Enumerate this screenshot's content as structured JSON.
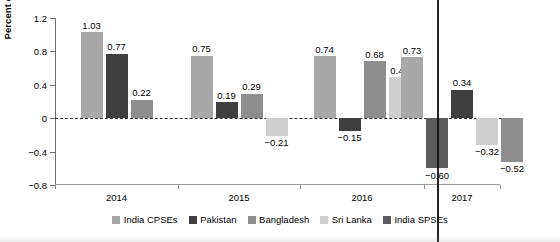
{
  "chart_data": {
    "type": "bar",
    "title": "",
    "xlabel": "",
    "ylabel": "Percent of GDP",
    "categories": [
      "2014",
      "2015",
      "2016",
      "2017"
    ],
    "ylim": [
      -0.8,
      1.2
    ],
    "yticks": [
      -0.8,
      -0.4,
      0,
      0.4,
      0.8,
      1.2
    ],
    "ytick_labels": [
      "−0.8",
      "−0.4",
      "0",
      "0.4",
      "0.8",
      "1.2"
    ],
    "grid": false,
    "zero_line": true,
    "legend_position": "bottom",
    "series": [
      {
        "name": "India CPSEs",
        "color": "#a8a8a8",
        "values": [
          1.03,
          0.75,
          0.74,
          0.73
        ],
        "labels": [
          "1.03",
          "0.75",
          "0.74",
          "0.73"
        ]
      },
      {
        "name": "Pakistan",
        "color": "#3f3f3f",
        "values": [
          0.77,
          0.19,
          -0.15,
          0.34
        ],
        "labels": [
          "0.77",
          "0.19",
          "−0.15",
          "0.34"
        ]
      },
      {
        "name": "Bangladesh",
        "color": "#8e8e8e",
        "values": [
          0.22,
          0.29,
          0.68,
          -0.52
        ],
        "labels": [
          "0.22",
          "0.29",
          "0.68",
          "−0.52"
        ]
      },
      {
        "name": "Sri Lanka",
        "color": "#cfcfcf",
        "values": [
          null,
          -0.21,
          0.49,
          -0.32
        ],
        "labels": [
          "",
          "−0.21",
          "0.49",
          "−0.32"
        ]
      },
      {
        "name": "India SPSEs",
        "color": "#5c5c5c",
        "values": [
          null,
          null,
          null,
          -0.6
        ],
        "labels": [
          "",
          "",
          "",
          "−0.60"
        ]
      }
    ]
  },
  "legend": {
    "items": [
      {
        "label": "India CPSEs",
        "color": "#a8a8a8"
      },
      {
        "label": "Pakistan",
        "color": "#3f3f3f"
      },
      {
        "label": "Bangladesh",
        "color": "#8e8e8e"
      },
      {
        "label": "Sri Lanka",
        "color": "#cfcfcf"
      },
      {
        "label": "India SPSEs",
        "color": "#5c5c5c"
      }
    ]
  }
}
